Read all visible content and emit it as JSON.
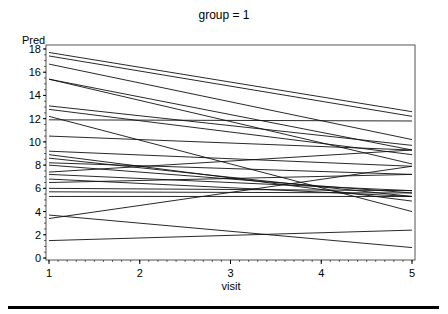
{
  "chart_data": {
    "type": "line",
    "title": "group = 1",
    "xlabel": "visit",
    "ylabel": "Pred",
    "xlim": [
      1,
      5
    ],
    "ylim": [
      0,
      18
    ],
    "x_ticks": [
      1,
      2,
      3,
      4,
      5
    ],
    "y_ticks": [
      0,
      2,
      4,
      6,
      8,
      10,
      12,
      14,
      16,
      18
    ],
    "grid": false,
    "legend": "none",
    "x": [
      1,
      5
    ],
    "series": [
      {
        "name": "subject-1",
        "values": [
          17.7,
          12.6
        ]
      },
      {
        "name": "subject-2",
        "values": [
          17.4,
          12.2
        ]
      },
      {
        "name": "subject-3",
        "values": [
          16.7,
          10.2
        ]
      },
      {
        "name": "subject-4",
        "values": [
          15.4,
          9.3
        ]
      },
      {
        "name": "subject-5",
        "values": [
          15.4,
          8.1
        ]
      },
      {
        "name": "subject-6",
        "values": [
          13.1,
          9.7
        ]
      },
      {
        "name": "subject-7",
        "values": [
          12.8,
          8.9
        ]
      },
      {
        "name": "subject-8",
        "values": [
          12.2,
          4.0
        ]
      },
      {
        "name": "subject-9",
        "values": [
          11.9,
          11.8
        ]
      },
      {
        "name": "subject-10",
        "values": [
          10.5,
          9.3
        ]
      },
      {
        "name": "subject-11",
        "values": [
          9.2,
          7.9
        ]
      },
      {
        "name": "subject-12",
        "values": [
          8.9,
          4.9
        ]
      },
      {
        "name": "subject-13",
        "values": [
          8.6,
          5.3
        ]
      },
      {
        "name": "subject-14",
        "values": [
          8.2,
          7.2
        ]
      },
      {
        "name": "subject-15",
        "values": [
          8.0,
          5.6
        ]
      },
      {
        "name": "subject-16",
        "values": [
          7.4,
          9.3
        ]
      },
      {
        "name": "subject-17",
        "values": [
          7.2,
          5.8
        ]
      },
      {
        "name": "subject-18",
        "values": [
          6.8,
          5.3
        ]
      },
      {
        "name": "subject-19",
        "values": [
          6.5,
          7.2
        ]
      },
      {
        "name": "subject-20",
        "values": [
          6.0,
          5.8
        ]
      },
      {
        "name": "subject-21",
        "values": [
          5.7,
          5.6
        ]
      },
      {
        "name": "subject-22",
        "values": [
          5.3,
          5.3
        ]
      },
      {
        "name": "subject-23",
        "values": [
          3.7,
          0.9
        ]
      },
      {
        "name": "subject-24",
        "values": [
          3.4,
          7.9
        ]
      },
      {
        "name": "subject-25",
        "values": [
          1.5,
          2.4
        ]
      }
    ]
  }
}
